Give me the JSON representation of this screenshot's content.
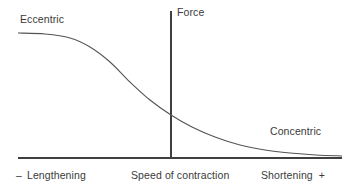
{
  "figure": {
    "background_color": "#ffffff",
    "line_color": "#545454",
    "axis_color": "#3f3f3f",
    "text_color": "#3a3a3a"
  },
  "labels": {
    "eccentric": "Eccentric",
    "concentric": "Concentric",
    "force_axis": "Force",
    "x_axis_center": "Speed of contraction",
    "x_axis_left": "Lengthening",
    "x_axis_right": "Shortening",
    "sign_minus": "–",
    "sign_plus": "+"
  },
  "chart_data": {
    "type": "line",
    "title": "",
    "xlabel": "Speed of contraction",
    "ylabel": "Force",
    "xlim": [
      -1,
      1
    ],
    "ylim": [
      0,
      1
    ],
    "grid": false,
    "legend": "none",
    "annotations": [
      {
        "text": "Eccentric",
        "x": -0.86,
        "y": 0.93,
        "note": "lengthening side, high force plateau"
      },
      {
        "text": "Concentric",
        "x": 0.62,
        "y": 0.24,
        "note": "shortening side, low force tail"
      },
      {
        "text": "Force",
        "x": 0.02,
        "y": 1.0,
        "note": "vertical axis label at isometric point"
      },
      {
        "text": "– Lengthening",
        "x": -0.88,
        "y": -0.1
      },
      {
        "text": "Speed of contraction",
        "x": 0.0,
        "y": -0.1
      },
      {
        "text": "Shortening +",
        "x": 0.8,
        "y": -0.1
      }
    ],
    "axes": {
      "x_axis_y_pixel": 158,
      "y_axis_x_pixel": 171,
      "x_axis_from_pixel": 18,
      "x_axis_to_pixel": 342,
      "y_axis_from_pixel": 11,
      "y_axis_to_pixel": 158,
      "note": "Vertical Force axis sits at zero velocity (isometric); curve crosses it at the isometric force value."
    },
    "series": [
      {
        "name": "Force-velocity curve",
        "color": "#545454",
        "x": [
          -0.95,
          -0.8,
          -0.65,
          -0.5,
          -0.38,
          -0.25,
          -0.12,
          0.0,
          0.12,
          0.25,
          0.4,
          0.55,
          0.7,
          0.85,
          1.0
        ],
        "y": [
          0.855,
          0.845,
          0.82,
          0.76,
          0.665,
          0.545,
          0.42,
          0.295,
          0.215,
          0.15,
          0.1,
          0.07,
          0.05,
          0.037,
          0.03
        ],
        "pixel_points": [
          {
            "x": 18,
            "y": 33
          },
          {
            "x": 45,
            "y": 34
          },
          {
            "x": 70,
            "y": 38
          },
          {
            "x": 90,
            "y": 47
          },
          {
            "x": 110,
            "y": 62
          },
          {
            "x": 130,
            "y": 82
          },
          {
            "x": 150,
            "y": 100
          },
          {
            "x": 171,
            "y": 115
          },
          {
            "x": 192,
            "y": 127
          },
          {
            "x": 215,
            "y": 137
          },
          {
            "x": 240,
            "y": 145
          },
          {
            "x": 265,
            "y": 150
          },
          {
            "x": 290,
            "y": 153
          },
          {
            "x": 316,
            "y": 155
          },
          {
            "x": 342,
            "y": 156
          }
        ]
      }
    ]
  }
}
